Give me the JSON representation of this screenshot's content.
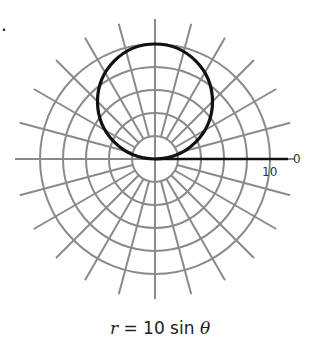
{
  "problem": {
    "number": "7."
  },
  "graph": {
    "type": "polar",
    "center_px": [
      155,
      159
    ],
    "ring_spacing_px": 23,
    "ring_count": 5,
    "ring_values": [
      2,
      4,
      6,
      8,
      10
    ],
    "spoke_step_deg": 15,
    "spoke_outer_px": 140,
    "spoke_inner_px": 23,
    "grid_color": "#8a8a8a",
    "curve_color": "#111111",
    "polar_axis_end_px": 288,
    "labels": {
      "angle_zero": "0",
      "radius_max": "10"
    }
  },
  "curve": {
    "equation_lhs": "r",
    "equation_eq": " = ",
    "equation_rhs_num": "10 sin ",
    "equation_rhs_var": "θ",
    "diameter": 10
  },
  "chart_data": {
    "type": "polar",
    "title": "r = 10 sin θ",
    "rings": [
      2,
      4,
      6,
      8,
      10
    ],
    "spokes_deg": [
      0,
      15,
      30,
      45,
      60,
      75,
      90,
      105,
      120,
      135,
      150,
      165,
      180,
      195,
      210,
      225,
      240,
      255,
      270,
      285,
      300,
      315,
      330,
      345
    ],
    "series": [
      {
        "name": "r = 10 sin θ",
        "shape": "circle",
        "center_cartesian": [
          0,
          5
        ],
        "radius": 5
      }
    ],
    "axis_labels": {
      "theta_zero": "0",
      "r_max": "10"
    },
    "grid": true
  }
}
